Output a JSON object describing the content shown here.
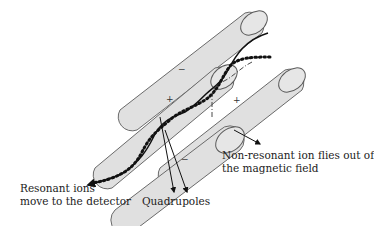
{
  "diagram": {
    "rods": [
      {
        "id": "top-left",
        "polarity": "−"
      },
      {
        "id": "upper-right",
        "polarity": "+"
      },
      {
        "id": "lower-left",
        "polarity": "+"
      },
      {
        "id": "bottom",
        "polarity": "−"
      }
    ],
    "signs": {
      "s1": "−",
      "s2": "+",
      "s3": "+",
      "s4": "−"
    },
    "labels": {
      "resonant_line1": "Resonant ions",
      "resonant_line2": "move to the detector",
      "quadrupoles": "Quadrupoles",
      "nonresonant_line1": "Non-resonant ion flies out of",
      "nonresonant_line2": "the magnetic field"
    },
    "paths": [
      {
        "name": "resonant-ion-path-solid",
        "style": "solid"
      },
      {
        "name": "resonant-ion-path-dotted",
        "style": "dotted"
      },
      {
        "name": "non-resonant-ion-path",
        "style": "dash-dot"
      }
    ],
    "colors": {
      "rod_fill": "#e0e0e0",
      "rod_stroke": "#6a6a6a",
      "path": "#111111"
    }
  }
}
